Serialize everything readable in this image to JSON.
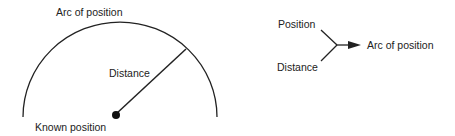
{
  "left_diagram": {
    "arc_label": "Arc of position",
    "radius_label": "Distance",
    "center_label": "Known position"
  },
  "right_diagram": {
    "inputs": [
      "Position",
      "Distance"
    ],
    "output": "Arc of position"
  },
  "colors": {
    "stroke": "#222222",
    "background": "#ffffff"
  }
}
